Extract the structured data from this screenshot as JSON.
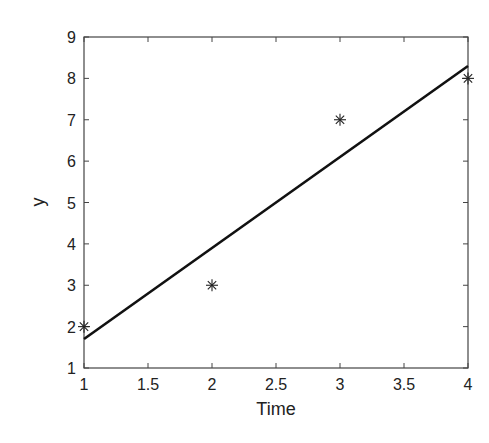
{
  "chart_data": {
    "type": "scatter",
    "title": "",
    "xlabel": "Time",
    "ylabel": "y",
    "xlim": [
      1,
      4
    ],
    "ylim": [
      1,
      9
    ],
    "xticks": [
      1,
      1.5,
      2,
      2.5,
      3,
      3.5,
      4
    ],
    "xtick_labels": [
      "1",
      "1.5",
      "2",
      "2.5",
      "3",
      "3.5",
      "4"
    ],
    "yticks": [
      1,
      2,
      3,
      4,
      5,
      6,
      7,
      8,
      9
    ],
    "ytick_labels": [
      "1",
      "2",
      "3",
      "4",
      "5",
      "6",
      "7",
      "8",
      "9"
    ],
    "grid": false,
    "legend": null,
    "series": [
      {
        "name": "data",
        "type": "scatter",
        "marker": "asterisk",
        "x": [
          1,
          2,
          3,
          4
        ],
        "y": [
          2,
          3,
          7,
          8
        ]
      },
      {
        "name": "linear fit",
        "type": "line",
        "x": [
          1,
          4
        ],
        "y": [
          1.7,
          8.3
        ]
      }
    ]
  }
}
